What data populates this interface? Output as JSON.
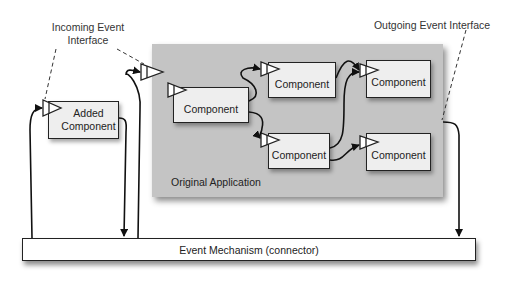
{
  "diagram": {
    "callouts": {
      "incoming": {
        "line1": "Incoming Event",
        "line2": "Interface"
      },
      "outgoing": {
        "label": "Outgoing Event Interface"
      }
    },
    "original_application": {
      "label": "Original Application",
      "fill_color": "#c4c4c4",
      "components": [
        {
          "id": "c1",
          "label": "Component"
        },
        {
          "id": "c2",
          "label": "Component"
        },
        {
          "id": "c3",
          "label": "Component"
        },
        {
          "id": "c4",
          "label": "Component"
        },
        {
          "id": "c5",
          "label": "Component"
        }
      ]
    },
    "added_component": {
      "line1": "Added",
      "line2": "Component"
    },
    "event_mechanism": {
      "label": "Event Mechanism (connector)"
    },
    "edges": [
      {
        "from": "c1",
        "to": "c2"
      },
      {
        "from": "c1",
        "to": "c3"
      },
      {
        "from": "c2",
        "to": "c4"
      },
      {
        "from": "c3",
        "to": "c4"
      },
      {
        "from": "c3",
        "to": "c5"
      },
      {
        "from": "original_application",
        "to": "event_mechanism",
        "via": "outgoing-event-interface"
      },
      {
        "from": "event_mechanism",
        "to": "added_component"
      },
      {
        "from": "added_component",
        "to": "event_mechanism"
      },
      {
        "from": "event_mechanism",
        "to": "incoming-event-interface"
      }
    ]
  }
}
